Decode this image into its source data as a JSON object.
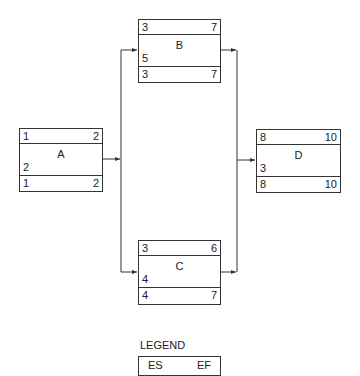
{
  "nodes": {
    "A": {
      "name": "A",
      "es": "1",
      "ef": "2",
      "duration": "2",
      "ls": "1",
      "lf": "2"
    },
    "B": {
      "name": "B",
      "es": "3",
      "ef": "7",
      "duration": "5",
      "ls": "3",
      "lf": "7"
    },
    "C": {
      "name": "C",
      "es": "3",
      "ef": "6",
      "duration": "4",
      "ls": "4",
      "lf": "7"
    },
    "D": {
      "name": "D",
      "es": "8",
      "ef": "10",
      "duration": "3",
      "ls": "8",
      "lf": "10"
    }
  },
  "edges": [
    {
      "from": "A",
      "to": "B"
    },
    {
      "from": "A",
      "to": "C"
    },
    {
      "from": "B",
      "to": "D"
    },
    {
      "from": "C",
      "to": "D"
    }
  ],
  "legend": {
    "title": "LEGEND",
    "es_label": "ES",
    "ef_label": "EF"
  },
  "colors": {
    "line": "#333333",
    "background": "#ffffff"
  }
}
